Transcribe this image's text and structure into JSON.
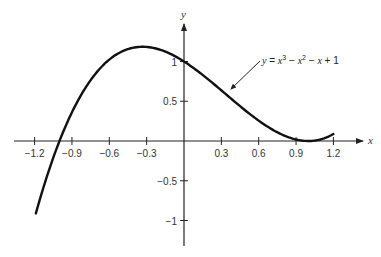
{
  "chart_data": {
    "type": "line",
    "title": "",
    "xlabel": "x",
    "ylabel": "y",
    "xlim": [
      -1.4,
      1.45
    ],
    "ylim": [
      -1.3,
      1.45
    ],
    "grid": false,
    "legend": null,
    "x_ticks": [
      -1.2,
      -0.9,
      -0.6,
      -0.3,
      0.3,
      0.6,
      0.9,
      1.2
    ],
    "x_tick_labels": [
      "−1.2",
      "−0.9",
      "−0.6",
      "−0.3",
      "0.3",
      "0.6",
      "0.9",
      "1.2"
    ],
    "y_ticks": [
      1,
      0.5,
      -0.5,
      -1
    ],
    "y_tick_labels": [
      "1",
      "0.5",
      "−0.5",
      "−1"
    ],
    "series": [
      {
        "name": "y = x^3 - x^2 - x + 1",
        "function": "x^3 - x^2 - x + 1",
        "x_range": [
          -1.19,
          1.2
        ],
        "color": "#111111",
        "points": [
          [
            -1.19,
            -0.911
          ],
          [
            -1.0,
            0.0
          ],
          [
            -0.9,
            0.361
          ],
          [
            -0.6,
            0.904
          ],
          [
            -0.333,
            1.185
          ],
          [
            -0.3,
            1.183
          ],
          [
            0.0,
            1.0
          ],
          [
            0.3,
            0.637
          ],
          [
            0.6,
            0.256
          ],
          [
            0.9,
            0.019
          ],
          [
            1.0,
            0.0
          ],
          [
            1.2,
            0.088
          ]
        ]
      }
    ],
    "annotations": [
      {
        "text_parts": [
          {
            "t": "y",
            "italic": true
          },
          {
            "t": " = ",
            "italic": false
          },
          {
            "t": "x",
            "italic": true
          },
          {
            "t": "3",
            "sup": true
          },
          {
            "t": " − ",
            "italic": false
          },
          {
            "t": "x",
            "italic": true
          },
          {
            "t": "2",
            "sup": true
          },
          {
            "t": " − ",
            "italic": false
          },
          {
            "t": "x",
            "italic": true
          },
          {
            "t": " + 1",
            "italic": false
          }
        ],
        "arrow_to": [
          0.36,
          0.557
        ]
      }
    ]
  },
  "labels": {
    "x_axis": "x",
    "y_axis": "y",
    "equation_y": "y",
    "equation_eq": " = ",
    "equation_x1": "x",
    "equation_p3": "3",
    "equation_m1": " − ",
    "equation_x2": "x",
    "equation_p2": "2",
    "equation_m2": " − ",
    "equation_x3": "x",
    "equation_end": " + 1"
  }
}
